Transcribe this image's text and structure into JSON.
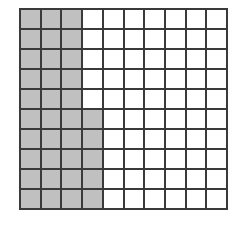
{
  "diagram": {
    "type": "hundred-grid",
    "rows": 10,
    "columns": 10,
    "shaded_count": 35,
    "shaded_cells": {
      "full_columns": [
        0,
        1,
        2
      ],
      "partial_column": {
        "column": 3,
        "rows": [
          5,
          6,
          7,
          8,
          9
        ]
      }
    },
    "colors": {
      "shaded": "#c0c0c0",
      "unshaded": "#ffffff",
      "gridline": "#3a3a3a"
    }
  }
}
